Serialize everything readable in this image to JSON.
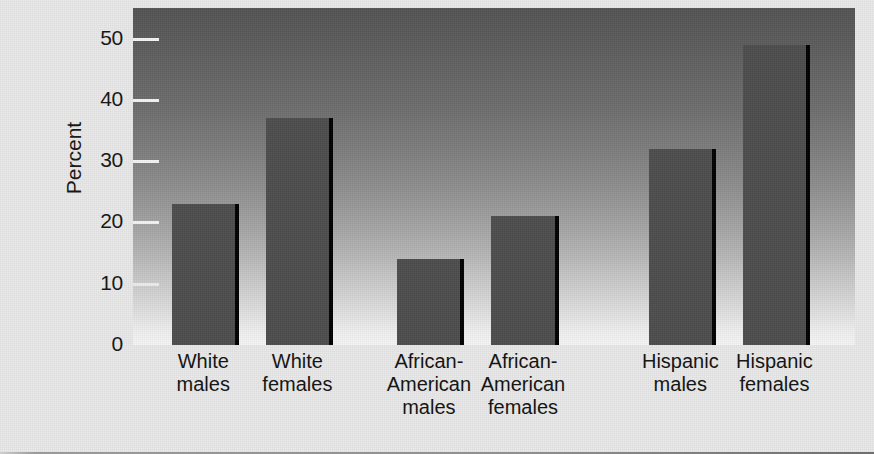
{
  "chart_data": {
    "type": "bar",
    "title": "",
    "xlabel": "",
    "ylabel": "Percent",
    "ylim": [
      0,
      55
    ],
    "yticks": [
      0,
      10,
      20,
      30,
      40,
      50
    ],
    "ytick_labels": [
      "0",
      "10",
      "20",
      "30",
      "40",
      "50"
    ],
    "grid": false,
    "legend": "none",
    "categories": [
      "White\nmales",
      "White\nfemales",
      "African-\nAmerican\nmales",
      "African-\nAmerican\nfemales",
      "Hispanic\nmales",
      "Hispanic\nfemales"
    ],
    "values": [
      23,
      37,
      14,
      21,
      32,
      49
    ],
    "bar_color": "#4d4d4d",
    "bar_edge_color": "#000000",
    "plot_background": "gradient-dark-top-to-light-bottom",
    "plot_background_top_color": "#535353",
    "plot_background_bottom_color": "#f6f6f6",
    "figure_background": "#e9e9e9"
  },
  "axis": {
    "y_title": "Percent",
    "ticks": [
      {
        "label": "50",
        "value": 50
      },
      {
        "label": "40",
        "value": 40
      },
      {
        "label": "30",
        "value": 30
      },
      {
        "label": "20",
        "value": 20
      },
      {
        "label": "10",
        "value": 10
      },
      {
        "label": "0",
        "value": 0
      }
    ]
  },
  "bars": [
    {
      "label": "White\nmales",
      "value": 23
    },
    {
      "label": "White\nfemales",
      "value": 37
    },
    {
      "label": "African-\nAmerican\nmales",
      "value": 14
    },
    {
      "label": "African-\nAmerican\nfemales",
      "value": 21
    },
    {
      "label": "Hispanic\nmales",
      "value": 32
    },
    {
      "label": "Hispanic\nfemales",
      "value": 49
    }
  ]
}
